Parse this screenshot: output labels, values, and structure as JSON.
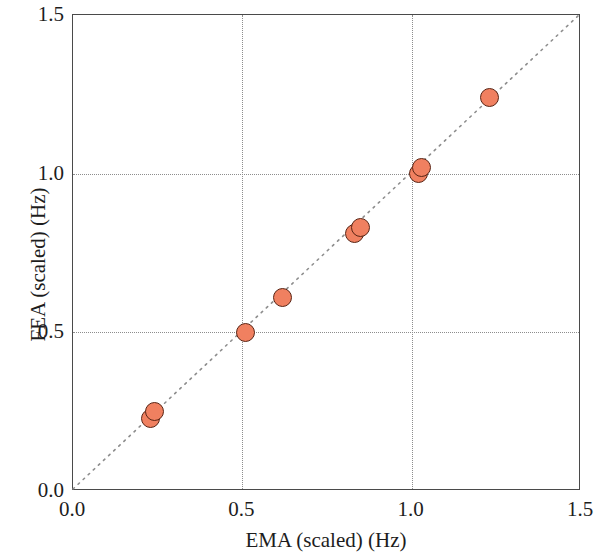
{
  "chart_data": {
    "type": "scatter",
    "title": "",
    "xlabel": "EMA (scaled) (Hz)",
    "ylabel": "FEA (scaled) (Hz)",
    "xlim": [
      0.0,
      1.5
    ],
    "ylim": [
      0.0,
      1.5
    ],
    "xticks": [
      "0.0",
      "0.5",
      "1.0",
      "1.5"
    ],
    "yticks": [
      "0.0",
      "0.5",
      "1.0",
      "1.5"
    ],
    "xtick_values": [
      0.0,
      0.5,
      1.0,
      1.5
    ],
    "ytick_values": [
      0.0,
      0.5,
      1.0,
      1.5
    ],
    "grid": "dotted gridlines at 0.5 and 1.0 on both axes",
    "legend": "none",
    "marker_fill": "#f08060",
    "marker_edge": "#5a2414",
    "marker_shape": "circle",
    "reference_line": {
      "name": "identity-line",
      "description": "1:1 dotted diagonal from (0,0) to (1.5,1.5)",
      "x": [
        0.0,
        1.5
      ],
      "y": [
        0.0,
        1.5
      ],
      "style": "dotted",
      "color": "#8d8d8d"
    },
    "points": [
      {
        "x": 0.23,
        "y": 0.23
      },
      {
        "x": 0.24,
        "y": 0.25
      },
      {
        "x": 0.51,
        "y": 0.5
      },
      {
        "x": 0.62,
        "y": 0.61
      },
      {
        "x": 0.83,
        "y": 0.81
      },
      {
        "x": 0.85,
        "y": 0.83
      },
      {
        "x": 1.02,
        "y": 1.0
      },
      {
        "x": 1.03,
        "y": 1.02
      },
      {
        "x": 1.23,
        "y": 1.24
      }
    ]
  }
}
